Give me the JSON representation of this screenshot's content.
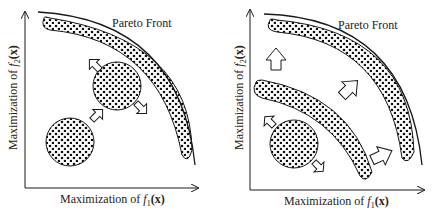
{
  "panels": [
    {
      "id": "left",
      "front_label": "Pareto Front",
      "x_axis": {
        "prefix": "Maximization of ",
        "fn": "f",
        "sub": "1",
        "arg": "(x)"
      },
      "y_axis": {
        "prefix": "Maximization of ",
        "fn": "f",
        "sub": "2",
        "arg": "(x)"
      }
    },
    {
      "id": "right",
      "front_label": "Pareto Front",
      "x_axis": {
        "prefix": "Maximization of ",
        "fn": "f",
        "sub": "1",
        "arg": "(x)"
      },
      "y_axis": {
        "prefix": "Maximization of ",
        "fn": "f",
        "sub": "2",
        "arg": "(x)"
      }
    }
  ],
  "colors": {
    "ink": "#1a1a1a",
    "background": "#ffffff"
  }
}
